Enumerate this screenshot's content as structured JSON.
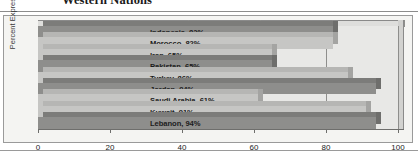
{
  "figure": {
    "title": "Western Nations"
  },
  "chart_data": {
    "type": "bar",
    "orientation": "horizontal",
    "title": "Western Nations",
    "xlabel": "",
    "ylabel": "Percent Expressing Admiration",
    "xlim": [
      0,
      100
    ],
    "xticks": [
      "0",
      "20",
      "40",
      "60",
      "80",
      "100"
    ],
    "grid": true,
    "legend": "none",
    "categories": [
      "Indonesia",
      "Morocco",
      "Iran",
      "Pakistan",
      "Turkey",
      "Jordan",
      "Saudi Arabia",
      "Kuwait",
      "Lebanon"
    ],
    "values": [
      82,
      82,
      65,
      65,
      86,
      94,
      61,
      91,
      94
    ],
    "bars": [
      {
        "label": "Indonesia, 82%",
        "category": "Indonesia",
        "value": 82,
        "shade": "dark"
      },
      {
        "label": "Morocco, 82%",
        "category": "Morocco",
        "value": 82,
        "shade": "light"
      },
      {
        "label": "Iran, 65%",
        "category": "Iran",
        "value": 65,
        "shade": "light"
      },
      {
        "label": "Pakistan, 65%",
        "category": "Pakistan",
        "value": 65,
        "shade": "dark"
      },
      {
        "label": "Turkey, 86%",
        "category": "Turkey",
        "value": 86,
        "shade": "light"
      },
      {
        "label": "Jordan, 94%",
        "category": "Jordan",
        "value": 94,
        "shade": "dark"
      },
      {
        "label": "Saudi Arabia, 61%",
        "category": "Saudi Arabia",
        "value": 61,
        "shade": "light"
      },
      {
        "label": "Kuwait, 91%",
        "category": "Kuwait",
        "value": 91,
        "shade": "light"
      },
      {
        "label": "Lebanon, 94%",
        "category": "Lebanon",
        "value": 94,
        "shade": "dark"
      }
    ],
    "colors": {
      "bar_dark": "#8e8e8c",
      "bar_light": "#c6c6c4",
      "plot_background": "#e8e8e6",
      "frame_background": "#f4f4f2",
      "axis": "#6e6e6c",
      "text": "#1c1c1c"
    }
  }
}
